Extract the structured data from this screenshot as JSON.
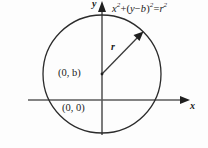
{
  "figure": {
    "background_color": "#fdfdfd",
    "stroke_color": "#2b2b2b",
    "axis_color": "#555555",
    "equation": {
      "full_text": "x^2 + (y - b)^2 = r^2",
      "x_term": "x",
      "x_exponent": "2",
      "plus": "+",
      "open_paren": "(",
      "y_term": "y",
      "minus": "−",
      "b_term": "b",
      "close_paren": ")",
      "group_exponent": "2",
      "equals": "=",
      "r_term": "r",
      "r_exponent": "2"
    },
    "axes": {
      "y_label": "y",
      "x_label": "x",
      "y_axis_x_px": 102,
      "x_axis_y_px": 100,
      "y_axis_top_px": 8,
      "y_axis_bottom_px": 135,
      "x_axis_left_px": 28,
      "x_axis_right_px": 188
    },
    "circle": {
      "center_x_px": 102,
      "center_y_px": 74,
      "radius_px": 59,
      "center_label": "(0, b)",
      "center_label_x": "0",
      "center_label_b": "b"
    },
    "origin": {
      "label": "(0, 0)",
      "x_px": 102,
      "y_px": 100
    },
    "radius_arrow": {
      "label": "r",
      "from_x_px": 102,
      "from_y_px": 74,
      "to_x_px": 142,
      "to_y_px": 33
    }
  }
}
